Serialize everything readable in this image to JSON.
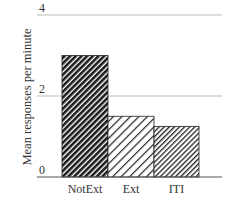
{
  "chart_data": {
    "type": "bar",
    "title": "",
    "xlabel": "",
    "ylabel": "Mean responses per minute",
    "categories": [
      "NotExt",
      "Ext",
      "ITI"
    ],
    "values": [
      3.0,
      1.5,
      1.25
    ],
    "ylim": [
      0,
      4
    ],
    "yticks": [
      0,
      2,
      4
    ],
    "grid": true,
    "legend": null,
    "bar_patterns": [
      "dense-dark-hatch",
      "sparse-diagonal-hatch",
      "medium-diagonal-hatch"
    ]
  },
  "colors": {
    "axis": "#555555",
    "grid": "#bbbbbb",
    "text": "#333333",
    "bar_fill_dark": "#1a1a1a",
    "bar_stroke": "#222222"
  }
}
